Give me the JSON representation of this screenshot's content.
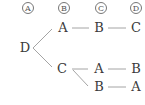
{
  "diagram": {
    "type": "tree",
    "headers": [
      "A",
      "B",
      "C",
      "D"
    ],
    "root": "D",
    "rows": [
      [
        "A",
        "B",
        "C"
      ],
      [
        "C",
        "A",
        "B"
      ],
      [
        "",
        "B",
        "A"
      ]
    ],
    "edges": [
      [
        "D",
        "A (row 1)"
      ],
      [
        "D",
        "C (row 2)"
      ],
      [
        "A (row 1)",
        "B (row 1)"
      ],
      [
        "B (row 1)",
        "C (row 1)"
      ],
      [
        "C (row 2)",
        "A (row 2)"
      ],
      [
        "A (row 2)",
        "B (row 2)"
      ],
      [
        "C (row 2)",
        "B (row 3)"
      ],
      [
        "B (row 3)",
        "A (row 3)"
      ]
    ],
    "colors": {
      "text": "#3a3a3a",
      "line": "#9a9a9a",
      "header_circle": "#777777"
    }
  }
}
